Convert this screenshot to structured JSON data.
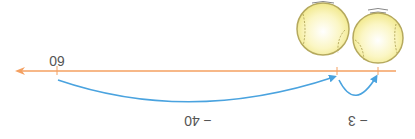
{
  "diagram": {
    "orientation": "rotated 180 degrees (upside down)",
    "number_line": {
      "color": "#f4a061",
      "labels": {
        "start": "60"
      }
    },
    "jumps": [
      {
        "label": "− 40",
        "color": "#4aa3df"
      },
      {
        "label": "− 3",
        "color": "#4aa3df"
      }
    ],
    "objects": [
      {
        "type": "tennis-ball",
        "color": "#f7f1a6",
        "outline": "#b5a95e"
      },
      {
        "type": "tennis-ball",
        "color": "#f7f1a6",
        "outline": "#b5a95e"
      }
    ]
  }
}
